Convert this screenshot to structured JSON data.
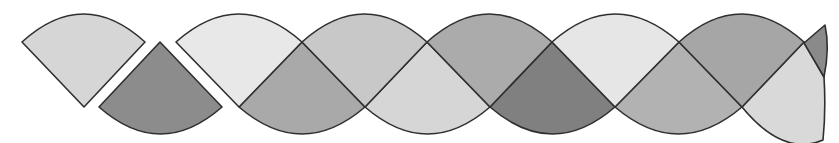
{
  "diagram": {
    "title": "",
    "stroke_color": "#2f2f2f",
    "background": "#ffffff",
    "loose_pieces": [
      {
        "name": "loose-sector-up",
        "fill": "#d6d6d6",
        "points": {
          "left": [
            22,
            42
          ],
          "right": [
            145,
            42
          ],
          "apex": [
            84,
            107
          ],
          "arc_peak_y": 14
        }
      },
      {
        "name": "loose-sector-down",
        "fill": "#8c8c8c",
        "points": {
          "left": [
            99,
            107
          ],
          "right": [
            222,
            107
          ],
          "apex": [
            160,
            42
          ],
          "arc_trough_y": 134
        }
      }
    ],
    "band": {
      "upper_y": 42,
      "lower_y": 107,
      "arc_top_y": 14,
      "arc_bottom_y": 134,
      "upper_sectors": [
        {
          "x1": 176,
          "x2": 302,
          "apex_x": 239,
          "fill": "#e8e8e8"
        },
        {
          "x1": 302,
          "x2": 427,
          "apex_x": 365,
          "fill": "#c8c8c8"
        },
        {
          "x1": 427,
          "x2": 552,
          "apex_x": 490,
          "fill": "#ababab"
        },
        {
          "x1": 552,
          "x2": 679,
          "apex_x": 615,
          "fill": "#e6e6e6"
        },
        {
          "x1": 679,
          "x2": 804,
          "apex_x": 742,
          "fill": "#a6a6a6"
        }
      ],
      "lower_sectors": [
        {
          "x1": 239,
          "x2": 365,
          "apex_x": 302,
          "fill": "#a9a9a9"
        },
        {
          "x1": 365,
          "x2": 490,
          "apex_x": 427,
          "fill": "#d6d6d6"
        },
        {
          "x1": 490,
          "x2": 615,
          "apex_x": 552,
          "fill": "#808080"
        },
        {
          "x1": 615,
          "x2": 742,
          "apex_x": 679,
          "fill": "#b2b2b2"
        },
        {
          "x1": 742,
          "x2": 823,
          "apex_x": 804,
          "fill": "#d9d9d9"
        }
      ],
      "end_tip": {
        "fill": "#8a8a8a",
        "points": [
          [
            804,
            43
          ],
          [
            825,
            25
          ],
          [
            824,
            77
          ]
        ]
      }
    }
  }
}
